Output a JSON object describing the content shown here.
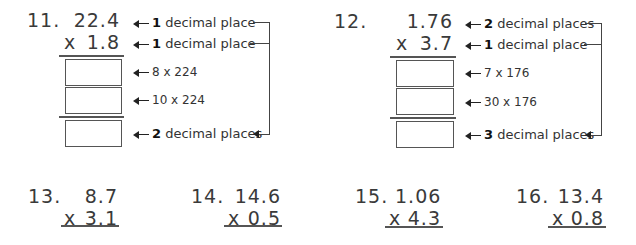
{
  "problems_top": [
    {
      "number": "11.",
      "multiplicand": "22.4",
      "multiplier_sign": "x",
      "multiplier": "1.8",
      "notes": {
        "multiplicand": {
          "count": "1",
          "text": "decimal place"
        },
        "multiplier": {
          "count": "1",
          "text": "decimal place"
        },
        "partial1": "8 x 224",
        "partial2": "10 x 224",
        "product": {
          "count": "2",
          "text": "decimal places"
        }
      },
      "answers": {
        "partial1": "",
        "partial2": "",
        "product": ""
      }
    },
    {
      "number": "12.",
      "multiplicand": "1.76",
      "multiplier_sign": "x",
      "multiplier": "3.7",
      "notes": {
        "multiplicand": {
          "count": "2",
          "text": "decimal places"
        },
        "multiplier": {
          "count": "1",
          "text": "decimal place"
        },
        "partial1": "7 x 176",
        "partial2": "30 x 176",
        "product": {
          "count": "3",
          "text": "decimal places"
        }
      },
      "answers": {
        "partial1": "",
        "partial2": "",
        "product": ""
      }
    }
  ],
  "problems_bottom": [
    {
      "number": "13.",
      "multiplicand": "8.7",
      "multiplier_sign": "x",
      "multiplier": "3.1"
    },
    {
      "number": "14.",
      "multiplicand": "14.6",
      "multiplier_sign": "x",
      "multiplier": "0.5"
    },
    {
      "number": "15.",
      "multiplicand": "1.06",
      "multiplier_sign": "x",
      "multiplier": "4.3"
    },
    {
      "number": "16.",
      "multiplicand": "13.4",
      "multiplier_sign": "x",
      "multiplier": "0.8"
    }
  ]
}
